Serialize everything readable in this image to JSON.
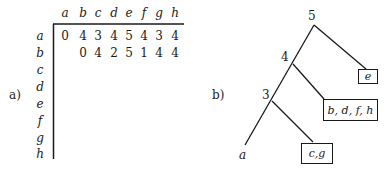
{
  "panel_a": {
    "label": "a)",
    "columns": [
      "a",
      "b",
      "c",
      "d",
      "e",
      "f",
      "g",
      "h"
    ],
    "rows": [
      "a",
      "b",
      "c",
      "d",
      "e",
      "f",
      "g",
      "h"
    ],
    "matrix": {
      "a": [
        "0",
        "4",
        "3",
        "4",
        "5",
        "4",
        "3",
        "4"
      ],
      "b": [
        "0",
        "4",
        "2",
        "5",
        "1",
        "4",
        "4"
      ]
    }
  },
  "panel_b": {
    "label": "b)",
    "nodes": [
      {
        "id": "n5",
        "label": "5"
      },
      {
        "id": "n4",
        "label": "4"
      },
      {
        "id": "n3",
        "label": "3"
      }
    ],
    "leaves": [
      {
        "id": "leaf-e",
        "label": "e",
        "boxed": true,
        "parent": "n5"
      },
      {
        "id": "leaf-bdfh",
        "label": "b, d, f, h",
        "boxed": true,
        "parent": "n4"
      },
      {
        "id": "leaf-cg",
        "label": "c,g",
        "boxed": true,
        "parent": "n3"
      },
      {
        "id": "leaf-a",
        "label": "a",
        "boxed": false,
        "parent": "n3"
      }
    ]
  }
}
